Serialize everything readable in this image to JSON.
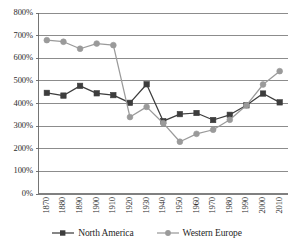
{
  "chart_data": {
    "type": "line",
    "title": "",
    "subtitle": "",
    "xlabel": "",
    "ylabel": "",
    "categories": [
      "1870",
      "1880",
      "1890",
      "1900",
      "1910",
      "1920",
      "1930",
      "1940",
      "1950",
      "1960",
      "1970",
      "1980",
      "1990",
      "2000",
      "2010"
    ],
    "ytick_labels": [
      "0%",
      "100%",
      "200%",
      "300%",
      "400%",
      "500%",
      "600%",
      "700%",
      "800%"
    ],
    "ytick_values": [
      0,
      100,
      200,
      300,
      400,
      500,
      600,
      700,
      800
    ],
    "ylim": [
      0,
      800
    ],
    "grid": "horizontal",
    "legend_position": "bottom",
    "series": [
      {
        "name": "North America",
        "color": "#3d3d3d",
        "marker": "square",
        "values": [
          447,
          435,
          478,
          445,
          437,
          403,
          485,
          322,
          353,
          358,
          327,
          350,
          392,
          444,
          405
        ]
      },
      {
        "name": "Western Europe",
        "color": "#9a9a9a",
        "marker": "circle",
        "values": [
          680,
          673,
          642,
          665,
          658,
          340,
          385,
          313,
          231,
          266,
          284,
          328,
          392,
          484,
          543
        ]
      }
    ]
  },
  "legend": {
    "items": [
      {
        "label": "North America",
        "marker": "square-marker-icon"
      },
      {
        "label": "Western Europe",
        "marker": "circle-marker-icon"
      }
    ]
  },
  "colors": {
    "north_america": "#3d3d3d",
    "western_europe": "#9a9a9a",
    "gridline": "#808080",
    "axis": "#666666",
    "text": "#2b2b2b"
  }
}
